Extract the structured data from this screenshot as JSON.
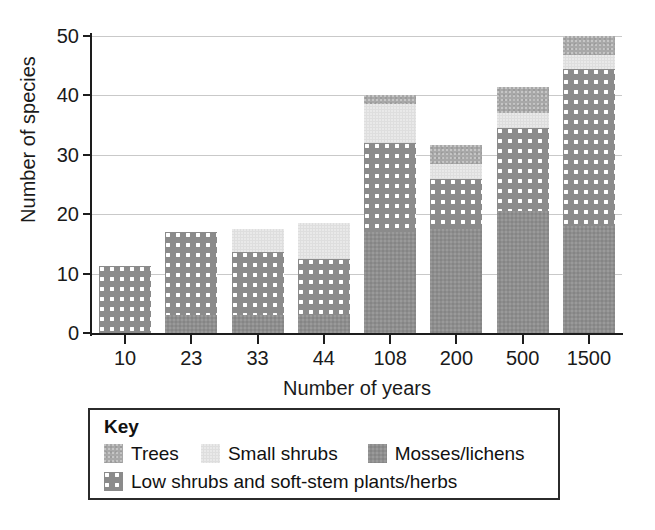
{
  "chart_data": {
    "type": "bar",
    "subtype": "stacked-bar",
    "title": "",
    "xlabel": "Number of years",
    "ylabel": "Number of species",
    "categories": [
      "10",
      "23",
      "33",
      "44",
      "108",
      "200",
      "500",
      "1500"
    ],
    "ylim": [
      0,
      50
    ],
    "yticks": [
      0,
      10,
      20,
      30,
      40,
      50
    ],
    "grid": "horizontal",
    "legend_position": "below-plot",
    "legend_title": "Key",
    "stack_order_bottom_to_top": [
      "Mosses/lichens",
      "Low shrubs and soft-stem plants/herbs",
      "Small shrubs",
      "Trees"
    ],
    "series": [
      {
        "name": "Mosses/lichens",
        "color": "#8e8e8e",
        "pattern": "solid-grain",
        "values": [
          0,
          3,
          3,
          3,
          17,
          17.5,
          20.5,
          18
        ]
      },
      {
        "name": "Low shrubs and soft-stem plants/herbs",
        "color": "#8b8b8b",
        "pattern": "white-dots",
        "values": [
          11.3,
          14,
          10.7,
          9.5,
          15,
          8.5,
          14,
          26.5
        ]
      },
      {
        "name": "Small shrubs",
        "color": "#dedede",
        "pattern": "light-solid",
        "values": [
          0,
          0,
          3.8,
          6,
          6.5,
          2.5,
          2.5,
          2.3
        ]
      },
      {
        "name": "Trees",
        "color": "#a8a8a8",
        "pattern": "medium-solid",
        "values": [
          0,
          0,
          0,
          0,
          1.5,
          3.2,
          4.5,
          3.2
        ]
      }
    ],
    "totals": [
      11.3,
      17,
      17.5,
      18.5,
      40,
      31.7,
      41.5,
      50
    ]
  },
  "legend": {
    "title": "Key",
    "entries": [
      {
        "label": "Trees",
        "swatch": "trees-swatch"
      },
      {
        "label": "Small shrubs",
        "swatch": "small-shrubs-swatch"
      },
      {
        "label": "Mosses/lichens",
        "swatch": "mosses-lichens-swatch"
      },
      {
        "label": "Low shrubs and soft-stem plants/herbs",
        "swatch": "low-shrubs-swatch"
      }
    ]
  },
  "axes": {
    "y_title": "Number of species",
    "x_title": "Number of years",
    "y_tick_labels": [
      "0",
      "10",
      "20",
      "30",
      "40",
      "50"
    ],
    "x_tick_labels": [
      "10",
      "23",
      "33",
      "44",
      "108",
      "200",
      "500",
      "1500"
    ]
  }
}
